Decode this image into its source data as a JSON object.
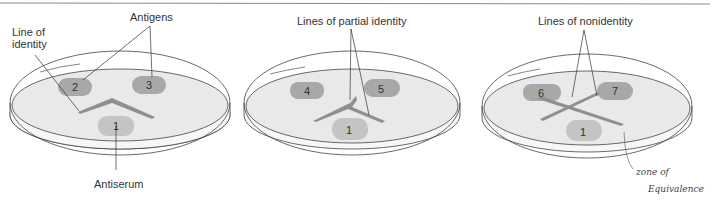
{
  "diagram": {
    "type": "immunodiffusion-ouchterlony",
    "colors": {
      "agar": "#e9e9e9",
      "antigen_well": "#a8a8a8",
      "antiserum_well": "#c4c4c4",
      "precipitin_line": "#8f8f8f",
      "outline": "#444444"
    },
    "panels": [
      {
        "title": "Line of identity",
        "labels": {
          "line": "Line of",
          "line2": "identity",
          "antigens": "Antigens",
          "antiserum": "Antiserum"
        },
        "wells": {
          "left": "2",
          "right": "3",
          "bottom": "1"
        }
      },
      {
        "title": "Lines of partial identity",
        "labels": {
          "top": "Lines of partial identity"
        },
        "wells": {
          "left": "4",
          "right": "5",
          "bottom": "1"
        }
      },
      {
        "title": "Lines of nonidentity",
        "labels": {
          "top": "Lines of nonidentity",
          "hand1": "zone of",
          "hand2": "Equivalence"
        },
        "wells": {
          "left": "6",
          "right": "7",
          "bottom": "1"
        }
      }
    ]
  }
}
